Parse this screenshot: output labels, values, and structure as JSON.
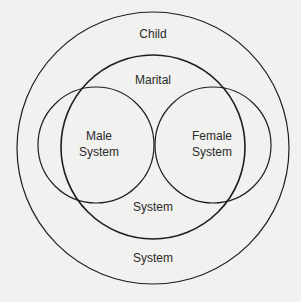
{
  "diagram": {
    "type": "nested-venn",
    "background": "#f1f1ef",
    "line_color": "#1e1e1e",
    "circles": [
      {
        "name": "Child System",
        "label_top": "Child",
        "label_bottom": "System"
      },
      {
        "name": "Marital System",
        "label_top": "Marital",
        "label_bottom": "System"
      },
      {
        "name": "Male System",
        "label_line1": "Male",
        "label_line2": "System"
      },
      {
        "name": "Female System",
        "label_line1": "Female",
        "label_line2": "System"
      }
    ]
  }
}
